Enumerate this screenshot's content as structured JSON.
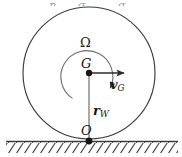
{
  "figure": {
    "background_color": "#ffffff",
    "stroke_color": "#3b3b3b",
    "text_color": "#161616",
    "width": 182,
    "height": 157,
    "labels": {
      "angular_velocity": "Ω",
      "center_point": "G",
      "velocity_vector_symbol": "v",
      "velocity_vector_subscript": "G",
      "radius_vector_symbol": "r",
      "radius_vector_subscript": "W",
      "contact_point": "O"
    },
    "geometry": {
      "circle_center_x": 89,
      "circle_center_y": 73,
      "circle_radius": 66,
      "contact_point_x": 89,
      "contact_point_y": 141,
      "ground_line_y": 141,
      "ground_line_x_start": 6,
      "ground_line_x_end": 178,
      "velocity_arrow_start_x": 89,
      "velocity_arrow_start_y": 73,
      "velocity_arrow_end_x": 129,
      "velocity_arrow_end_y": 73,
      "radius_arrow_start_x": 89,
      "radius_arrow_start_y": 141,
      "radius_arrow_end_x": 89,
      "radius_arrow_end_y": 73,
      "rotation_arc_radius": 26,
      "rotation_direction": "clockwise"
    },
    "top_crop_remnants": [
      {
        "text": "η",
        "left": 49
      },
      {
        "text": "σ",
        "left": 78
      },
      {
        "text": "σ",
        "left": 118
      }
    ]
  }
}
